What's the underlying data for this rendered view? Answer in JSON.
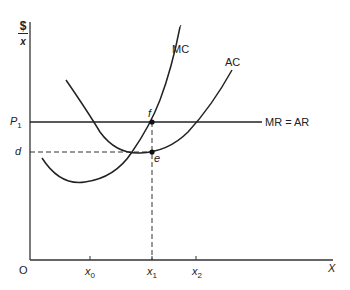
{
  "diagram": {
    "type": "economics cost curves",
    "y_axis": {
      "numerator": "$",
      "denominator": "x"
    },
    "x_axis": {
      "label": "X",
      "origin": "O"
    },
    "x_ticks": [
      {
        "base": "x",
        "sub": "0"
      },
      {
        "base": "x",
        "sub": "1"
      },
      {
        "base": "x",
        "sub": "2"
      }
    ],
    "y_ticks": [
      {
        "base": "P",
        "sub": "1"
      },
      {
        "base": "d",
        "sub": ""
      }
    ],
    "curves": {
      "mc": "MC",
      "ac": "AC",
      "price_line": "MR = AR"
    },
    "points": {
      "f": "f",
      "e": "e"
    },
    "colors": {
      "line": "#222222",
      "background": "#ffffff"
    }
  }
}
